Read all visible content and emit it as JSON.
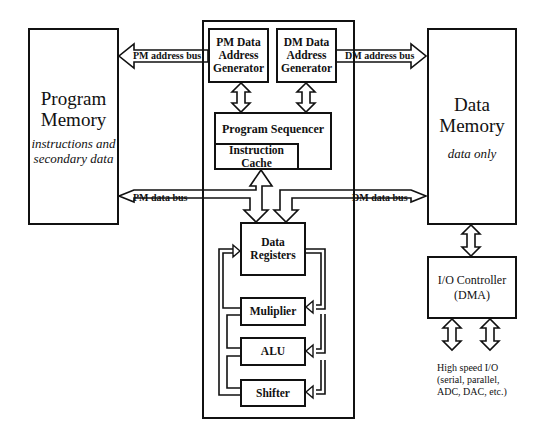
{
  "blocks": {
    "program_memory": {
      "title_line1": "Program",
      "title_line2": "Memory",
      "subtitle_line1": "instructions and",
      "subtitle_line2": "secondary data"
    },
    "data_memory": {
      "title_line1": "Data",
      "title_line2": "Memory",
      "subtitle": "data only"
    },
    "pm_dag": {
      "line1": "PM Data",
      "line2": "Address",
      "line3": "Generator"
    },
    "dm_dag": {
      "line1": "DM Data",
      "line2": "Address",
      "line3": "Generator"
    },
    "program_sequencer": {
      "label": "Program Sequencer"
    },
    "instruction_cache": {
      "line1": "Instruction",
      "line2": "Cache"
    },
    "data_registers": {
      "line1": "Data",
      "line2": "Registers"
    },
    "multiplier": {
      "label": "Muliplier"
    },
    "alu": {
      "label": "ALU"
    },
    "shifter": {
      "label": "Shifter"
    },
    "io_controller": {
      "line1": "I/O Controller",
      "line2": "(DMA)"
    }
  },
  "buses": {
    "pm_address": "PM address bus",
    "dm_address": "DM address bus",
    "pm_data": "PM data bus",
    "dm_data": "DM data bus"
  },
  "io_note": {
    "line1": "High speed I/O",
    "line2": "(serial, parallel,",
    "line3": "ADC, DAC, etc.)"
  },
  "colors": {
    "stroke": "#111111",
    "background": "#ffffff"
  }
}
